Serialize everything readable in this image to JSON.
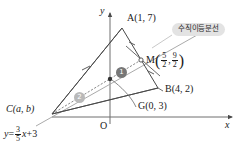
{
  "figure": {
    "type": "geometry-diagram",
    "axes": {
      "x_label": "x",
      "y_label": "y",
      "origin_label": "O"
    },
    "points": [
      {
        "name": "A",
        "label": "A(1, 7)",
        "x": 1,
        "y": 7,
        "px": 122,
        "py": 28
      },
      {
        "name": "B",
        "label": "B(4, 2)",
        "x": 4,
        "y": 2,
        "px": 158,
        "py": 88
      },
      {
        "name": "C",
        "label": "C(a, b)",
        "x": "a",
        "y": "b",
        "px": 52,
        "py": 114
      },
      {
        "name": "G",
        "label": "G(0, 3)",
        "x": 0,
        "y": 3,
        "px": 110,
        "py": 79
      },
      {
        "name": "M",
        "label": "M",
        "x": 2.5,
        "y": 4.5,
        "px": 141,
        "py": 60
      }
    ],
    "m_coord": {
      "prefix": "M",
      "num1": "5",
      "den1": "2",
      "sep": ",",
      "num2": "9",
      "den2": "2"
    },
    "line_equation": {
      "lhs": "y",
      "eq": "=",
      "num": "3",
      "den": "5",
      "var": "x",
      "plus": "+3"
    },
    "annotation_tag": "수직이등분선",
    "ratio_markers": [
      {
        "id": "one",
        "label": "❶",
        "text": "1",
        "px": 120,
        "py": 72
      },
      {
        "id": "two",
        "label": "❷",
        "text": "2",
        "px": 78,
        "py": 97
      }
    ],
    "colors": {
      "stroke": "#4a4a4a",
      "bisector": "#8e8e8e",
      "line_gray": "#9a9a9a",
      "tag_bg": "#e3e3e3",
      "marker_dark": "#777777",
      "marker_light": "#b9b9b9",
      "text": "#1a1a1a"
    }
  }
}
